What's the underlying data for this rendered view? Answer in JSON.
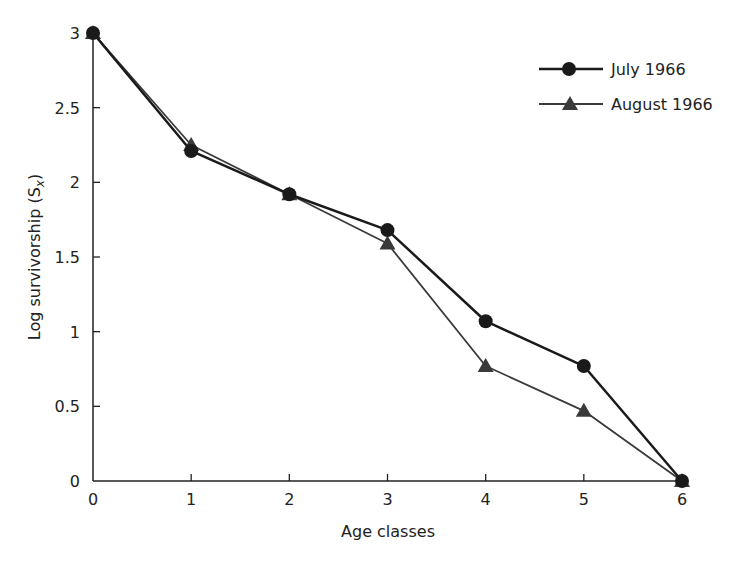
{
  "chart_data": {
    "type": "line",
    "title": "",
    "xlabel": "Age classes",
    "ylabel": "Log survivorship (S",
    "ylabel_subscript": "x",
    "ylabel_suffix": ")",
    "x": [
      0,
      1,
      2,
      3,
      4,
      5,
      6
    ],
    "xlim": [
      0,
      6
    ],
    "ylim": [
      0,
      3
    ],
    "x_ticks": [
      "0",
      "1",
      "2",
      "3",
      "4",
      "5",
      "6"
    ],
    "y_ticks": [
      {
        "value": 0,
        "label": "0"
      },
      {
        "value": 0.5,
        "label": "0.5"
      },
      {
        "value": 1,
        "label": "1"
      },
      {
        "value": 1.5,
        "label": "1.5"
      },
      {
        "value": 2,
        "label": "2"
      },
      {
        "value": 2.5,
        "label": "2.5"
      },
      {
        "value": 3,
        "label": "3"
      }
    ],
    "grid": false,
    "legend_position": "top-right",
    "series": [
      {
        "name": "July 1966",
        "marker": "circle",
        "color": "#1a1a1a",
        "values": [
          3.0,
          2.21,
          1.92,
          1.68,
          1.07,
          0.77,
          0.0
        ]
      },
      {
        "name": "August 1966",
        "marker": "triangle",
        "color": "#3a3a3a",
        "values": [
          3.0,
          2.25,
          1.92,
          1.59,
          0.77,
          0.47,
          0.0
        ]
      }
    ]
  }
}
